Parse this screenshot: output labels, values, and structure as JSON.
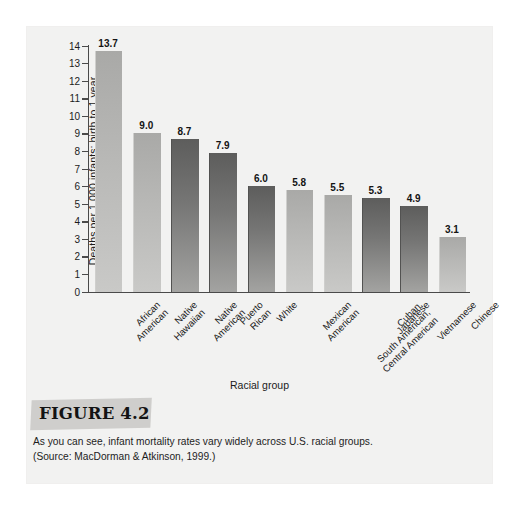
{
  "figure": {
    "label": "FIGURE 4.2",
    "caption_line1": "As you can see, infant mortality rates vary widely across U.S. racial groups.",
    "caption_line2": "(Source: MacDorman & Atkinson, 1999.)"
  },
  "chart_data": {
    "type": "bar",
    "title": "",
    "xlabel": "Racial group",
    "ylabel": "Deaths per 1,000 infants: birth to 1 year",
    "ylim": [
      0,
      14
    ],
    "yticks": [
      0,
      1,
      2,
      3,
      4,
      5,
      6,
      7,
      8,
      9,
      10,
      11,
      12,
      13,
      14
    ],
    "ytick_labels": [
      "0",
      "1",
      "2",
      "3",
      "4",
      "5",
      "6",
      "7",
      "8",
      "9",
      "10",
      "11",
      "12",
      "13",
      "14"
    ],
    "grid": false,
    "legend": "none",
    "categories": [
      "African American",
      "Native Hawaiian",
      "Native American",
      "Puerto Rican",
      "White",
      "Mexican American",
      "Cuban, South American, Central American",
      "Japanese",
      "Vietnamese",
      "Chinese"
    ],
    "category_lines": [
      [
        "African",
        "American"
      ],
      [
        "Native",
        "Hawaiian"
      ],
      [
        "Native",
        "American"
      ],
      [
        "Puerto",
        "Rican"
      ],
      [
        "White"
      ],
      [
        "Mexican",
        "American"
      ],
      [
        "Cuban,",
        "South American,",
        "Central American"
      ],
      [
        "Japanese"
      ],
      [
        "Vietnamese"
      ],
      [
        "Chinese"
      ]
    ],
    "values": [
      13.7,
      9.0,
      8.7,
      7.9,
      6.0,
      5.8,
      5.5,
      5.3,
      4.9,
      3.1
    ],
    "value_labels": [
      "13.7",
      "9.0",
      "8.7",
      "7.9",
      "6.0",
      "5.8",
      "5.5",
      "5.3",
      "4.9",
      "3.1"
    ],
    "bar_shades": [
      "light",
      "light",
      "dark",
      "dark",
      "dark",
      "light",
      "light",
      "dark",
      "dark",
      "light"
    ]
  },
  "colors": {
    "panel_background": "#f2f2f1",
    "page_background": "#ffffff",
    "axis": "#4a4a4a",
    "text": "#1b1b1b",
    "bar_light": "#b8b8b6",
    "bar_dark": "#767675",
    "figure_tab": "#cfcecc"
  }
}
